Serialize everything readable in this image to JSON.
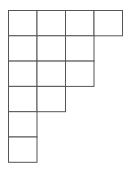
{
  "diagram": {
    "type": "young-diagram",
    "row_lengths": [
      4,
      3,
      3,
      2,
      1,
      1
    ],
    "line_color": "#555555",
    "fill_color": "#ffffff"
  }
}
